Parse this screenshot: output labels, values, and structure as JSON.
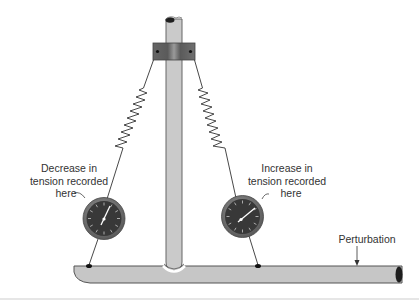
{
  "figure": {
    "type": "physics-apparatus-diagram",
    "colors": {
      "rod_fill": "#c8c8c8",
      "rod_stroke": "#555555",
      "clamp_fill": "#6e6e6e",
      "gauge_face": "#3a3a3a",
      "gauge_rim": "#7a7a7a",
      "wire": "#333333",
      "text": "#333333"
    }
  },
  "labels": {
    "left_gauge": {
      "lines": [
        "Decrease in",
        "tension recorded",
        "here"
      ]
    },
    "right_gauge": {
      "lines": [
        "Increase in",
        "tension recorded",
        "here"
      ]
    },
    "perturbation": "Perturbation"
  },
  "components": {
    "vertical_rod": "vertical-rod",
    "clamp": "clamp",
    "left_spring": "left-spring",
    "right_spring": "right-spring",
    "left_gauge": "tension-gauge-left",
    "right_gauge": "tension-gauge-right",
    "horizontal_beam": "horizontal-beam",
    "perturbation_arrow": "perturbation-arrow"
  }
}
